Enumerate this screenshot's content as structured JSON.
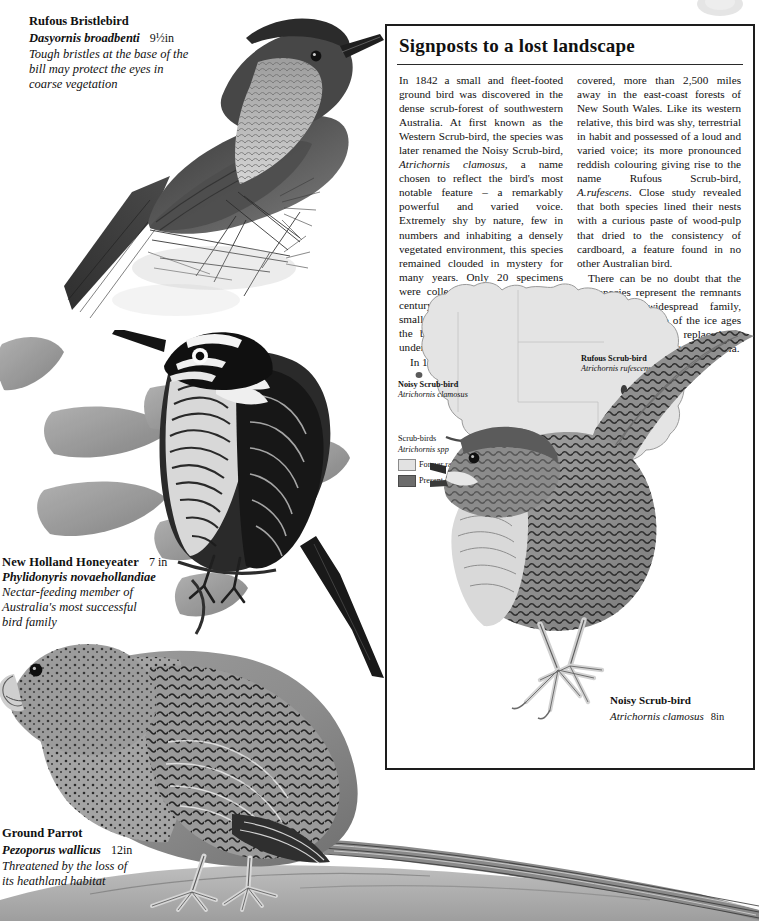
{
  "plate": {
    "birds": [
      {
        "id": "rufous-bristlebird",
        "common": "Rufous Bristlebird",
        "latin": "Dasyornis broadbenti",
        "size": "9½in",
        "note": "Tough bristles at the base of the bill may protect the eyes in coarse vegetation"
      },
      {
        "id": "new-holland-honeyeater",
        "common": "New Holland Honeyeater",
        "latin": "Phylidonyris novaehollandiae",
        "size": "7 in",
        "note": "Nectar-feeding member of Australia's most successful bird family"
      },
      {
        "id": "ground-parrot",
        "common": "Ground Parrot",
        "latin": "Pezoporus wallicus",
        "size": "12in",
        "note": "Threatened by the loss of its heathland habitat"
      }
    ]
  },
  "panel": {
    "title": "Signposts to a lost  landscape",
    "column_left": [
      "In 1842 a small and fleet-footed ground bird was discovered in the dense scrub-forest of southwestern Australia. At first known as the Western Scrub-bird, the species was later renamed the Noisy Scrub-bird, <i>Atrichornis clamosus</i>, a name chosen to reflect the bird's most notable feature – a remarkably powerful and varied voice. Extremely shy by nature, few in numbers and inhabiting a densely vegetated environment, this species remained clouded in mystery for many years. Only 20 specimens were collected by the turn of the century and when, in 1961, a second small population was discovered, the bird was immediately placed under rigid protection.",
      "In 1865 a second species was dis-"
    ],
    "column_right": [
      "covered, more than 2,500 miles away in the east-coast forests of New South Wales. Like its western relative, this bird was shy, terrestrial in habit and possessed of a loud and varied voice; its more pronounced reddish colouring giving rise to the name Rufous Scrub-bird, <i>A.rufescens</i>. Close study revealed that both species lined their nests with a curious paste of wood-pulp that dried to the consistency of cardboard, a feature found in no other Australian bird.",
      "There can be no doubt that the two species represent the remnants of a once widespread family, isolated at the close of the ice ages when arid conditions replaced the scrub woodland of central Australia."
    ],
    "inset_bird": {
      "common": "Noisy Scrub-bird",
      "latin": "Atrichornis clamosus",
      "size": "8in"
    }
  },
  "map": {
    "labels": [
      {
        "id": "noisy-scrub-bird",
        "common": "Noisy Scrub-bird",
        "latin": "Atrichornis clamosus"
      },
      {
        "id": "rufous-scrub-bird",
        "common": "Rufous Scrub-bird",
        "latin": "Atrichornis rufescens"
      }
    ],
    "legend": {
      "title_line1": "Scrub-birds",
      "title_line2": "Atrichornis spp",
      "former": "Former range",
      "present": "Present range"
    }
  },
  "colors": {
    "ink": "#1d1d1d",
    "paper": "#ffffff",
    "map_former": "#e2e2e2",
    "map_present": "#6c6c6c",
    "map_outline": "#9a9a9a"
  }
}
